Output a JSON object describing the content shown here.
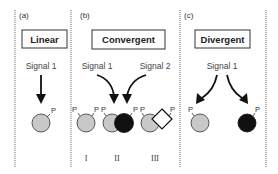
{
  "panels": {
    "a": {
      "label": "(a)",
      "title": "Linear",
      "signals": [
        "Signal 1"
      ],
      "phospho_label": "P"
    },
    "b": {
      "label": "(b)",
      "title": "Convergent",
      "signals": [
        "Signal 1",
        "Signal 2"
      ],
      "phospho_label": "P",
      "variants": [
        "I",
        "II",
        "III"
      ]
    },
    "c": {
      "label": "(c)",
      "title": "Divergent",
      "signals": [
        "Signal 1"
      ],
      "phospho_label": "P"
    }
  },
  "colors": {
    "gray_protein": "#c8c8c8",
    "dark_protein": "#111111",
    "outline": "#333333"
  }
}
